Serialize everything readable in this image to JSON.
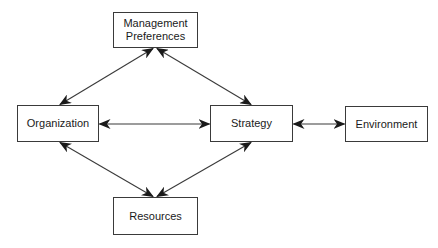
{
  "diagram": {
    "type": "flow-diagram",
    "colors": {
      "stroke": "#3a3a3a",
      "text": "#1a1a1a",
      "background": "#ffffff"
    },
    "nodes": [
      {
        "id": "mgmt",
        "lines": [
          "Management",
          "Preferences"
        ]
      },
      {
        "id": "org",
        "lines": [
          "Organization"
        ]
      },
      {
        "id": "strat",
        "lines": [
          "Strategy"
        ]
      },
      {
        "id": "env",
        "lines": [
          "Environment"
        ]
      },
      {
        "id": "res",
        "lines": [
          "Resources"
        ]
      }
    ],
    "edges": [
      {
        "from": "mgmt",
        "to": "org",
        "direction": "bidirectional"
      },
      {
        "from": "mgmt",
        "to": "strat",
        "direction": "bidirectional"
      },
      {
        "from": "org",
        "to": "strat",
        "direction": "bidirectional"
      },
      {
        "from": "strat",
        "to": "env",
        "direction": "bidirectional"
      },
      {
        "from": "org",
        "to": "res",
        "direction": "bidirectional"
      },
      {
        "from": "strat",
        "to": "res",
        "direction": "bidirectional"
      }
    ]
  }
}
